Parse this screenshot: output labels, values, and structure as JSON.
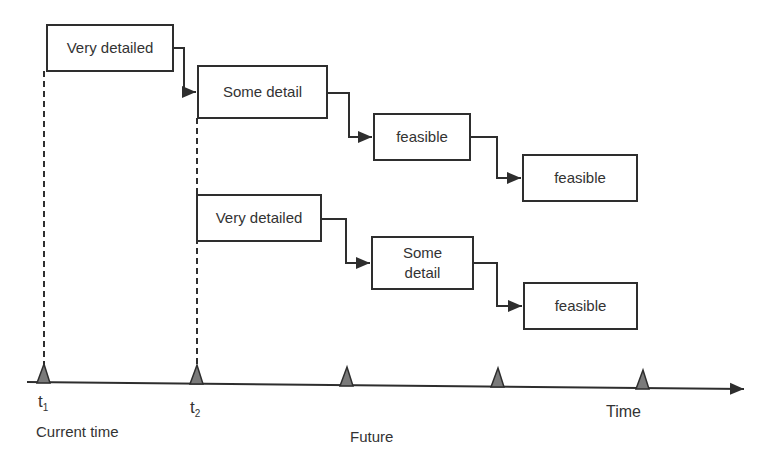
{
  "diagram": {
    "type": "rolling-horizon planning timeline",
    "plans": [
      {
        "start": "t1",
        "steps": [
          {
            "id": "a",
            "label": "Very detailed"
          },
          {
            "id": "b",
            "label": "Some detail"
          },
          {
            "id": "c",
            "label": "feasible"
          },
          {
            "id": "d",
            "label": "feasible"
          }
        ]
      },
      {
        "start": "t2",
        "steps": [
          {
            "id": "e",
            "label": "Very detailed"
          },
          {
            "id": "f",
            "label": "Some detail"
          },
          {
            "id": "g",
            "label": "feasible"
          }
        ]
      }
    ],
    "axis": {
      "label": "Time",
      "markers": [
        {
          "label": "t",
          "sub": "1"
        },
        {
          "label": "t",
          "sub": "2"
        },
        {
          "label": ""
        },
        {
          "label": ""
        },
        {
          "label": ""
        }
      ],
      "current_label": "Current time",
      "future_label": "Future"
    },
    "colors": {
      "stroke": "#2e2e2e",
      "marker_fill": "#7a7a7a"
    }
  }
}
